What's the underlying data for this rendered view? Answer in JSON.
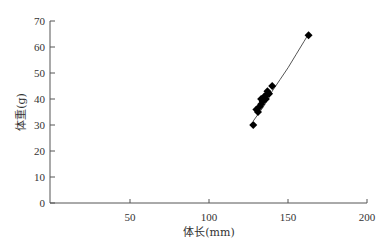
{
  "chart_data": {
    "type": "scatter",
    "title": "",
    "xlabel": "体长(mm)",
    "ylabel": "体重(g)",
    "xlim": [
      0,
      200
    ],
    "ylim": [
      0,
      70
    ],
    "x_ticks": [
      50,
      100,
      150,
      200
    ],
    "y_ticks": [
      0,
      10,
      20,
      30,
      40,
      50,
      60,
      70
    ],
    "grid": false,
    "legend": null,
    "marker": "diamond",
    "marker_color": "#000000",
    "series": [
      {
        "name": "observations",
        "points": [
          {
            "x": 128,
            "y": 30
          },
          {
            "x": 130,
            "y": 36
          },
          {
            "x": 131,
            "y": 35
          },
          {
            "x": 132,
            "y": 37
          },
          {
            "x": 133,
            "y": 38
          },
          {
            "x": 133,
            "y": 40
          },
          {
            "x": 134,
            "y": 39
          },
          {
            "x": 135,
            "y": 41
          },
          {
            "x": 136,
            "y": 40
          },
          {
            "x": 137,
            "y": 42
          },
          {
            "x": 137,
            "y": 43
          },
          {
            "x": 138,
            "y": 42
          },
          {
            "x": 140,
            "y": 45
          },
          {
            "x": 163,
            "y": 64.5
          }
        ]
      }
    ],
    "fit_curve": {
      "name": "power-fit",
      "color": "#555555",
      "points": [
        {
          "x": 128,
          "y": 31.5
        },
        {
          "x": 135,
          "y": 37.5
        },
        {
          "x": 140,
          "y": 43
        },
        {
          "x": 145,
          "y": 47.5
        },
        {
          "x": 150,
          "y": 52
        },
        {
          "x": 155,
          "y": 57
        },
        {
          "x": 160,
          "y": 62
        },
        {
          "x": 163,
          "y": 65
        }
      ]
    }
  }
}
